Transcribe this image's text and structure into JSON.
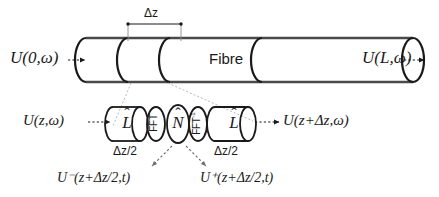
{
  "figure": {
    "kind": "split-step-fourier-fibre-schematic",
    "background_color": "#ffffff",
    "line_color": "#1a1a1a",
    "leader_color": "#9a9a9a"
  },
  "top_row": {
    "input_label": "U(0,ω)",
    "output_label": "U(L,ω)",
    "fibre_label": "Fibre",
    "step_dimension_label": "Δz",
    "input_arrow": "dotted-arrow-right",
    "output_arrow": "dotted-arrow-right"
  },
  "operator_row": {
    "input_label": "U(z,ω)",
    "output_label": "U(z+Δz,ω)",
    "input_arrow": "dotted-arrow-right",
    "output_arrow": "dotted-arrow-right",
    "blocks": [
      {
        "id": "linear-half-1",
        "glyph": "L",
        "accent": "hat",
        "shape": "cylinder"
      },
      {
        "id": "fft-forward",
        "glyph": "FFT",
        "accent": "none",
        "shape": "ellipse"
      },
      {
        "id": "nonlinear",
        "glyph": "N",
        "accent": "hat",
        "shape": "ellipse"
      },
      {
        "id": "fft-inverse",
        "glyph": "FFT",
        "superscript": "-1",
        "accent": "none",
        "shape": "ellipse"
      },
      {
        "id": "linear-half-2",
        "glyph": "L",
        "accent": "hat",
        "shape": "cylinder"
      }
    ],
    "halfstep_left_label": "Δz/2",
    "halfstep_right_label": "Δz/2"
  },
  "field_labels": {
    "before_nonlinear": "U⁻(z+Δz/2,t)",
    "after_nonlinear": "U⁺(z+Δz/2,t)"
  }
}
